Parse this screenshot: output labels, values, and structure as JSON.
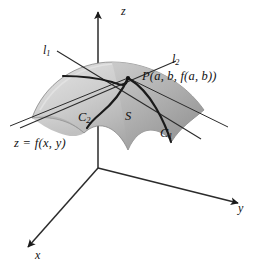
{
  "figure": {
    "background_color": "#ffffff",
    "ink_color": "#111111"
  },
  "axes": {
    "z_label": "z",
    "y_label": "y",
    "x_label": "x",
    "origin": {
      "x": 98,
      "y": 168
    }
  },
  "labels": {
    "tangent_line_1": {
      "base": "l",
      "sub": "1"
    },
    "tangent_line_2": {
      "base": "l",
      "sub": "2"
    },
    "curve_1": {
      "base": "C",
      "sub": "1"
    },
    "curve_2": {
      "base": "C",
      "sub": "2"
    },
    "surface": "S",
    "point": "P(a, b, f(a, b))",
    "equation": "z  =  f(x, y)"
  },
  "surface": {
    "fill_light": "#d4d4d4",
    "fill_mid": "#bdbdbd",
    "fill_dark": "#9a9a9a",
    "edge_color": "#6f6f6f"
  },
  "curves": {
    "stroke_color": "#1a1a1a",
    "stroke_width": 2.2
  },
  "tangent_lines": {
    "stroke_color": "#2b2b2b",
    "stroke_width": 1.1
  }
}
